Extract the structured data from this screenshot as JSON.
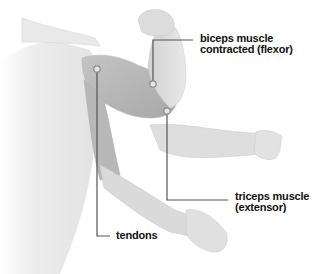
{
  "diagram": {
    "colors": {
      "background": "#ffffff",
      "body": "#e6e6e6",
      "muscle": "#bdbdbd",
      "muscle_dark": "#9f9f9f",
      "outline": "#cfcfcf",
      "leader_line": "#555555",
      "label_text": "#111111"
    },
    "labels": {
      "biceps": {
        "line1": "biceps muscle",
        "line2": "contracted (flexor)"
      },
      "triceps": {
        "line1": "triceps muscle",
        "line2": "(extensor)"
      },
      "tendons": {
        "line1": "tendons"
      }
    }
  }
}
